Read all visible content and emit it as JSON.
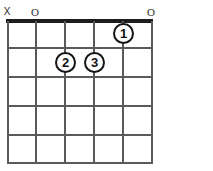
{
  "diagram": {
    "type": "guitar-chord-diagram",
    "title": "",
    "strings_count": 6,
    "frets_count": 5,
    "starting_fret": "",
    "colors": {
      "background": "#ffffff",
      "grid": "#5a5a5a",
      "nut": "#1d1d1d",
      "dot_stroke": "#141414",
      "dot_fill": "#ffffff",
      "text": "#111111",
      "marker": "#2b2b2b"
    },
    "geometry": {
      "string_x": [
        7,
        35,
        64,
        93,
        122,
        151
      ],
      "fret_y": [
        19,
        48,
        77,
        106,
        135,
        164
      ],
      "grid_left": 7,
      "grid_top": 19,
      "grid_width": 145,
      "grid_height": 145
    },
    "string_markers": [
      {
        "string": 1,
        "symbol": "X",
        "name": "muted-string-marker"
      },
      {
        "string": 2,
        "symbol": "O",
        "name": "open-string-marker"
      },
      {
        "string": 3,
        "symbol": "",
        "name": "no-marker"
      },
      {
        "string": 4,
        "symbol": "",
        "name": "no-marker"
      },
      {
        "string": 5,
        "symbol": "",
        "name": "no-marker"
      },
      {
        "string": 6,
        "symbol": "O",
        "name": "open-string-marker"
      }
    ],
    "finger_positions": [
      {
        "finger": "1",
        "string": 5,
        "fret": 1
      },
      {
        "finger": "2",
        "string": 3,
        "fret": 2
      },
      {
        "finger": "3",
        "string": 4,
        "fret": 2
      }
    ]
  }
}
